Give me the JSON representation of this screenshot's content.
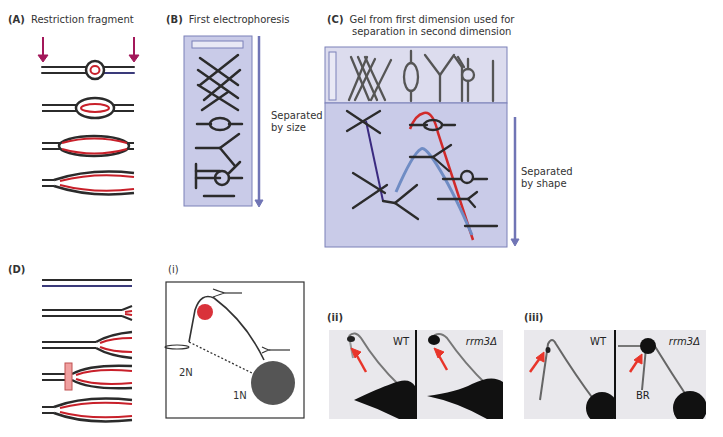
{
  "panels": {
    "A": {
      "letter": "(A)",
      "title": "Restriction fragment"
    },
    "B": {
      "letter": "(B)",
      "title": "First electrophoresis",
      "arrow_label_1": "Separated",
      "arrow_label_2": "by size"
    },
    "C": {
      "letter": "(C)",
      "title_1": "Gel from first dimension used for",
      "title_2": "separation in second dimension",
      "arrow_label_1": "Separated",
      "arrow_label_2": "by shape"
    },
    "D": {
      "letter": "(D)"
    },
    "i": {
      "letter": "(i)",
      "label_2n": "2N",
      "label_1n": "1N"
    },
    "ii": {
      "letter": "(ii)",
      "left_label": "WT",
      "right_label": "rrm3Δ"
    },
    "iii": {
      "letter": "(iii)",
      "left_label": "WT",
      "right_label": "rrm3Δ",
      "br_label": "BR"
    }
  },
  "colors": {
    "dna": "#2b2b2b",
    "nascent": "#c8202a",
    "cut_arrow": "#a3185a",
    "gel_fill": "#c9cbe8",
    "gel_border": "#7b80b8",
    "run_arrow": "#7075b5",
    "curve_red": "#d12a2a",
    "curve_blue": "#6f8cc4",
    "x_line": "#3a2a80",
    "fork_block": "#f0a0a0",
    "bubble_red": "#d9323a",
    "spot": "#555555"
  }
}
